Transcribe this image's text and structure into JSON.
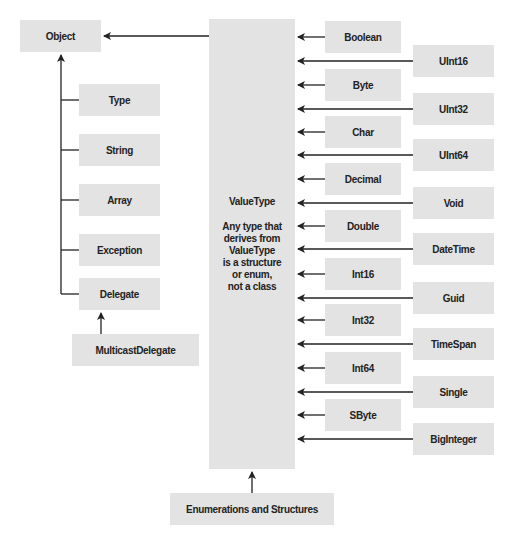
{
  "diagram": {
    "root": {
      "label": "Object"
    },
    "object_children": [
      {
        "label": "Type"
      },
      {
        "label": "String"
      },
      {
        "label": "Array"
      },
      {
        "label": "Exception"
      },
      {
        "label": "Delegate"
      }
    ],
    "delegate_child": {
      "label": "MulticastDelegate"
    },
    "value_type": {
      "title": "ValueType",
      "description": "Any type that\nderives from\nValueType\nis a structure\nor enum,\nnot a class"
    },
    "value_type_children_left": [
      {
        "label": "Boolean"
      },
      {
        "label": "Byte"
      },
      {
        "label": "Char"
      },
      {
        "label": "Decimal"
      },
      {
        "label": "Double"
      },
      {
        "label": "Int16"
      },
      {
        "label": "Int32"
      },
      {
        "label": "Int64"
      },
      {
        "label": "SByte"
      }
    ],
    "value_type_children_right": [
      {
        "label": "UInt16"
      },
      {
        "label": "UInt32"
      },
      {
        "label": "UInt64"
      },
      {
        "label": "Void"
      },
      {
        "label": "DateTime"
      },
      {
        "label": "Guid"
      },
      {
        "label": "TimeSpan"
      },
      {
        "label": "Single"
      },
      {
        "label": "BigInteger"
      }
    ],
    "enums_structs": {
      "label": "Enumerations and Structures"
    },
    "colors": {
      "box_fill": "#e3e3e3",
      "line": "#222222",
      "text": "#222222"
    }
  }
}
